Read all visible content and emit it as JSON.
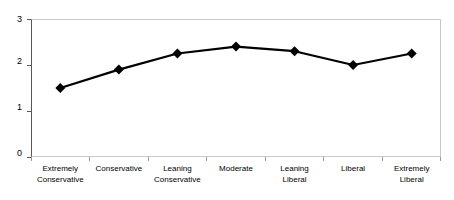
{
  "chart_data": {
    "type": "line",
    "title": "",
    "subtitle": "",
    "xlabel": "",
    "ylabel": "",
    "categories": [
      "Extremely Conservative",
      "Conservative",
      "Leaning Conservative",
      "Moderate",
      "Leaning Liberal",
      "Liberal",
      "Extremely Liberal"
    ],
    "category_lines": [
      [
        "Extremely",
        "Conservative"
      ],
      [
        "Conservative",
        ""
      ],
      [
        "Leaning",
        "Conservative"
      ],
      [
        "Moderate",
        ""
      ],
      [
        "Leaning",
        "Liberal"
      ],
      [
        "Liberal",
        ""
      ],
      [
        "Extremely",
        "Liberal"
      ]
    ],
    "values": [
      1.5,
      1.9,
      2.25,
      2.4,
      2.3,
      2.0,
      2.25
    ],
    "series": [
      {
        "name": "",
        "values": [
          1.5,
          1.9,
          2.25,
          2.4,
          2.3,
          2.0,
          2.25
        ],
        "color": "#000000",
        "marker": "diamond"
      }
    ],
    "ylim": [
      0,
      3
    ],
    "yticks": [
      0,
      1,
      2,
      3
    ],
    "ytick_labels": [
      "0",
      "1",
      "2",
      "3"
    ],
    "grid": false,
    "legend": false,
    "legend_position": "none"
  },
  "style": {
    "line_color": "#000000",
    "marker_color": "#000000",
    "axis_color": "#595959",
    "frame_color": "#c8c8c8",
    "tick_color": "#9a9a9a",
    "background": "#ffffff"
  }
}
